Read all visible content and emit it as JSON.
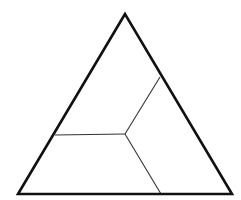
{
  "diagram": {
    "type": "triangle-partition",
    "canvas": {
      "width": 241,
      "height": 200,
      "background": "#ffffff"
    },
    "triangle": {
      "vertices": [
        {
          "name": "apex",
          "x": 125,
          "y": 14
        },
        {
          "name": "bottom-left",
          "x": 18,
          "y": 194
        },
        {
          "name": "bottom-right",
          "x": 232,
          "y": 194
        }
      ],
      "stroke": "#111111",
      "stroke_width": 2.6
    },
    "center_point": {
      "x": 125,
      "y": 134
    },
    "dividers": [
      {
        "name": "divider-to-right-edge",
        "from": {
          "x": 125,
          "y": 134
        },
        "to": {
          "x": 160,
          "y": 77
        }
      },
      {
        "name": "divider-to-left-edge",
        "from": {
          "x": 125,
          "y": 134
        },
        "to": {
          "x": 55,
          "y": 135
        }
      },
      {
        "name": "divider-to-base",
        "from": {
          "x": 125,
          "y": 134
        },
        "to": {
          "x": 161,
          "y": 194
        }
      }
    ],
    "divider_stroke": "#333333",
    "divider_stroke_width": 1.1,
    "regions": 3
  }
}
